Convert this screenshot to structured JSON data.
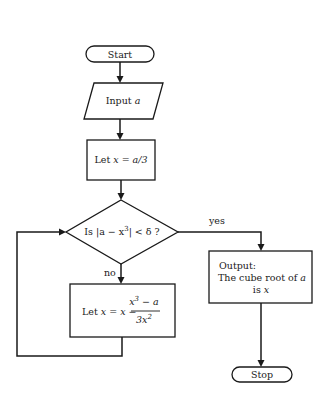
{
  "diagram": {
    "type": "flowchart",
    "nodes": {
      "start": {
        "shape": "terminator",
        "label": "Start"
      },
      "input": {
        "shape": "parallelogram",
        "label": "Input",
        "var": "a"
      },
      "init": {
        "shape": "process",
        "label_prefix": "Let",
        "expr": "x = a/3"
      },
      "decision": {
        "shape": "decision",
        "label_prefix": "Is |a − x",
        "exp": "3",
        "label_suffix": "| < δ ?"
      },
      "update": {
        "shape": "process",
        "label_prefix": "Let",
        "expr_lhs": "x = x −",
        "numerator": "x",
        "num_exp": "3",
        "num_rest": " − a",
        "denominator": "3x",
        "den_exp": "2"
      },
      "output": {
        "shape": "process",
        "line1": "Output:",
        "line2": "The cube root of",
        "line2_var": "a",
        "line3": "is",
        "line3_var": "x"
      },
      "stop": {
        "shape": "terminator",
        "label": "Stop"
      }
    },
    "edges": {
      "yes_label": "yes",
      "no_label": "no"
    }
  }
}
